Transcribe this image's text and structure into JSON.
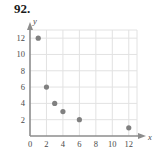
{
  "figure": {
    "problem_number": "92."
  },
  "chart_data": {
    "type": "scatter",
    "title": "92.",
    "xlabel": "x",
    "ylabel": "y",
    "xlim": [
      0,
      13
    ],
    "ylim": [
      0,
      13
    ],
    "xticks": [
      0,
      2,
      4,
      6,
      8,
      10,
      12
    ],
    "yticks": [
      2,
      4,
      6,
      8,
      10,
      12
    ],
    "xtick_labels": [
      "0",
      "2",
      "4",
      "6",
      "8",
      "10",
      "12"
    ],
    "ytick_labels": [
      "2",
      "4",
      "6",
      "8",
      "10",
      "12"
    ],
    "grid": true,
    "legend": null,
    "marker_color": "#808080",
    "grid_color": "#e2e2e2",
    "axis_color": "#8c8c8c",
    "points": [
      {
        "x": 1,
        "y": 12
      },
      {
        "x": 2,
        "y": 6
      },
      {
        "x": 3,
        "y": 4
      },
      {
        "x": 4,
        "y": 3
      },
      {
        "x": 6,
        "y": 2
      },
      {
        "x": 12,
        "y": 1
      }
    ]
  }
}
